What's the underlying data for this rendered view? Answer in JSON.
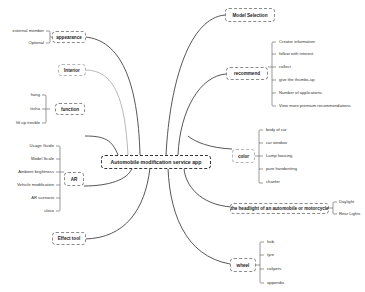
{
  "root": {
    "label": "Automobile modification service app"
  },
  "left_branches": [
    {
      "label": "appearance",
      "children": [
        "external member",
        "Optional"
      ]
    },
    {
      "label": "Interior",
      "children": []
    },
    {
      "label": "function",
      "children": [
        "hang",
        "tiisha",
        "lift up trouble"
      ]
    },
    {
      "label": "AR",
      "children": [
        "Usage Guide",
        "Model Scale",
        "Ambient brightness",
        "Vehicle modification",
        "AR scenario",
        "close"
      ]
    },
    {
      "label": "Effect tool",
      "children": []
    }
  ],
  "right_branches": [
    {
      "label": "Model Selection",
      "children": []
    },
    {
      "label": "recommend",
      "children": [
        "Creator information",
        "follow with interest",
        "collect",
        "give the thumbs-up",
        "Number of applications",
        "View more premium recommendations"
      ]
    },
    {
      "label": "color",
      "children": [
        "body of car",
        "car window",
        "Lamp housing",
        "pure handwriting",
        "chanfer"
      ]
    },
    {
      "label": "the headlight of an automobile or motorcycle",
      "children": [
        "Daylight",
        "Rear Lights"
      ]
    },
    {
      "label": "wheel",
      "children": [
        "hub",
        "tyre",
        "calipers",
        "appendix"
      ]
    }
  ],
  "colors": {
    "line_dark": "#444444",
    "line_light": "#b0b0b0",
    "border": "#8a8a8a",
    "background": "#ffffff"
  }
}
